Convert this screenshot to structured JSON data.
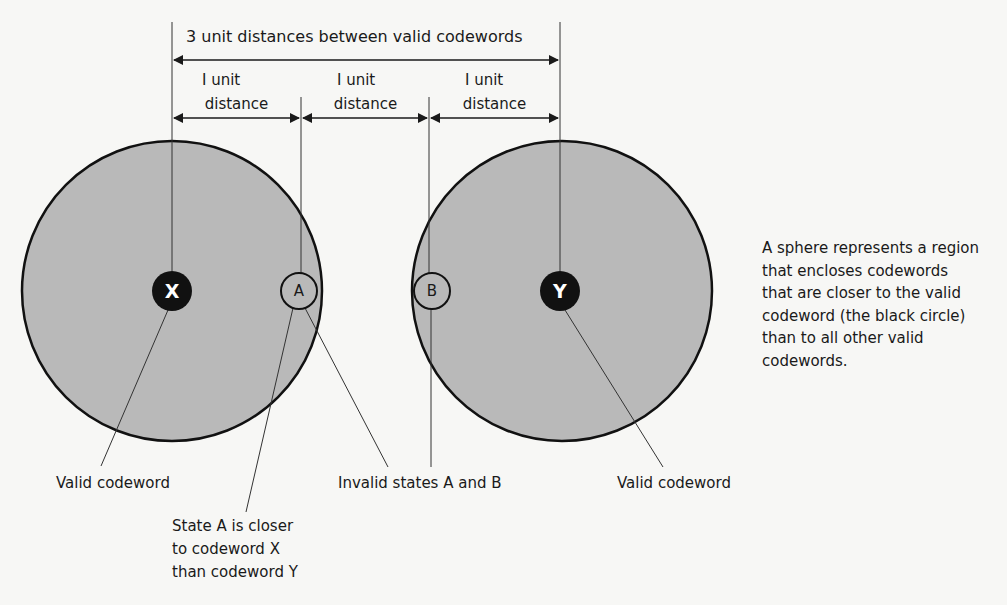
{
  "diagram": {
    "top_dimension": {
      "label": "3 unit distances between valid codewords"
    },
    "unit_dimensions": [
      {
        "line1": "I unit",
        "line2": "distance"
      },
      {
        "line1": "I unit",
        "line2": "distance"
      },
      {
        "line1": "I unit",
        "line2": "distance"
      }
    ],
    "spheres": [
      {
        "id": "sphere-x",
        "codeword": "X",
        "fill": "#b9b9b9"
      },
      {
        "id": "sphere-y",
        "codeword": "Y",
        "fill": "#b9b9b9"
      }
    ],
    "invalid_states": [
      {
        "label": "A"
      },
      {
        "label": "B"
      }
    ],
    "labels": {
      "valid_codeword_left": "Valid codeword",
      "valid_codeword_right": "Valid codeword",
      "invalid_states": "Invalid states A and B",
      "state_a_line1": "State A is closer",
      "state_a_line2": "to codeword X",
      "state_a_line3": "than codeword Y"
    },
    "description": [
      "A sphere represents a region",
      "that encloses codewords",
      "that are closer to the valid",
      "codeword (the black circle)",
      "than to all other valid",
      "codewords."
    ],
    "colors": {
      "sphere_fill": "#b9b9b9",
      "codeword_fill": "#111111",
      "line": "#1a1a1a",
      "background": "#f7f7f5"
    }
  }
}
